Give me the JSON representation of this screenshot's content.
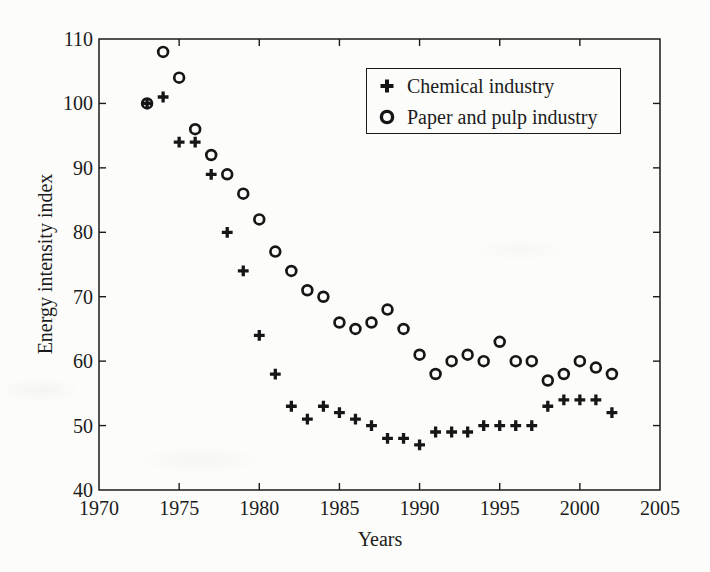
{
  "figure": {
    "background": "#fcfcfa",
    "ink_color": "#1b1b1b"
  },
  "chart_data": {
    "type": "scatter",
    "title": "",
    "xlabel": "Years",
    "ylabel": "Energy intensity index",
    "xlim": [
      1970,
      2005
    ],
    "ylim": [
      40,
      110
    ],
    "x_ticks": [
      1970,
      1975,
      1980,
      1985,
      1990,
      1995,
      2000,
      2005
    ],
    "y_ticks": [
      40,
      50,
      60,
      70,
      80,
      90,
      100,
      110
    ],
    "grid": false,
    "legend_position": "top-right-inside",
    "x": [
      1973,
      1974,
      1975,
      1976,
      1977,
      1978,
      1979,
      1980,
      1981,
      1982,
      1983,
      1984,
      1985,
      1986,
      1987,
      1988,
      1989,
      1990,
      1991,
      1992,
      1993,
      1994,
      1995,
      1996,
      1997,
      1998,
      1999,
      2000,
      2001,
      2002
    ],
    "series": [
      {
        "name": "Chemical industry",
        "marker": "plus",
        "color": "#161616",
        "values": [
          100,
          101,
          94,
          94,
          89,
          80,
          74,
          64,
          58,
          53,
          51,
          53,
          52,
          51,
          50,
          48,
          48,
          47,
          49,
          49,
          49,
          50,
          50,
          50,
          50,
          53,
          54,
          54,
          54,
          52
        ]
      },
      {
        "name": "Paper and pulp industry",
        "marker": "circle",
        "color": "#161616",
        "values": [
          100,
          108,
          104,
          96,
          92,
          89,
          86,
          82,
          77,
          74,
          71,
          70,
          66,
          65,
          66,
          68,
          65,
          61,
          58,
          60,
          61,
          60,
          63,
          60,
          60,
          57,
          58,
          60,
          59,
          58
        ]
      }
    ]
  }
}
